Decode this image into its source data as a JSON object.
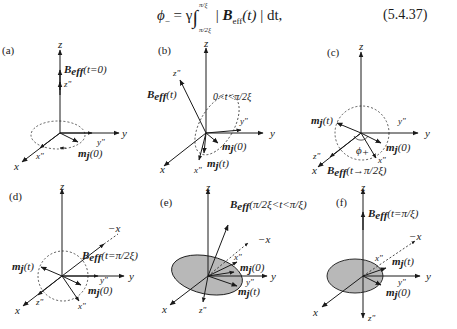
{
  "equation": {
    "lhs": "ϕ",
    "lhs_sub": "−",
    "equals": " = γ",
    "integral": "∫",
    "upper_limit": "π/ξ",
    "lower_limit": "π/2ξ",
    "integrand_bar_open": " | ",
    "integrand_B": "B",
    "integrand_sub": "eff",
    "integrand_arg": "(t)",
    "integrand_bar_close": " | dt,",
    "number": "(5.4.37)"
  },
  "panels": [
    {
      "id": "a",
      "label": "(a)",
      "axes": {
        "z": "z",
        "y": "y",
        "x": "x",
        "z2": "z\"",
        "y2": "y\"",
        "x2": "x\""
      },
      "field_label": {
        "B": "B",
        "sub": "eff",
        "arg": "(t=0)"
      },
      "m_labels": [
        "m_j(0)"
      ],
      "m0_label": {
        "m": "m",
        "sub": "j",
        "arg": "(0)"
      }
    },
    {
      "id": "b",
      "label": "(b)",
      "axes": {
        "z": "z",
        "y": "y",
        "x": "x",
        "z2": "z\"",
        "y2": "y\"",
        "x2": "x\""
      },
      "field_label": {
        "B": "B",
        "sub": "eff",
        "arg": "(t)"
      },
      "time_range": "0<t<π/2ξ",
      "m0_label": {
        "m": "m",
        "sub": "j",
        "arg": "(0)"
      },
      "mt_label": {
        "m": "m",
        "sub": "j",
        "arg": "(t)"
      }
    },
    {
      "id": "c",
      "label": "(c)",
      "axes": {
        "z": "z",
        "y": "y",
        "x": "x",
        "z2": "z\"",
        "y2": "y\"",
        "x2": "x\""
      },
      "field_label": {
        "B": "B",
        "sub": "eff",
        "arg": "(t→π/2ξ)"
      },
      "angle_label": "ϕ",
      "angle_sub": "+",
      "m0_label": {
        "m": "m",
        "sub": "j",
        "arg": "(0)"
      },
      "mt_label": {
        "m": "m",
        "sub": "j",
        "arg": "(t)"
      }
    },
    {
      "id": "d",
      "label": "(d)",
      "axes": {
        "z": "z",
        "y": "y",
        "x": "x",
        "negx": "−x",
        "z2": "z\"",
        "y2": "y\"",
        "x2": "x\""
      },
      "field_label": {
        "B": "B",
        "sub": "eff",
        "arg": "(t=π/2ξ)"
      },
      "m0_label": {
        "m": "m",
        "sub": "j",
        "arg": "(0)"
      },
      "mt_label": {
        "m": "m",
        "sub": "j",
        "arg": "(t)"
      }
    },
    {
      "id": "e",
      "label": "(e)",
      "axes": {
        "z": "z",
        "y": "y",
        "x": "x",
        "negx": "−x",
        "z2": "z\"",
        "y2": "y\"",
        "x2": "x\""
      },
      "field_label": {
        "B": "B",
        "sub": "eff",
        "arg": "(π/2ξ<t<π/ξ)"
      },
      "m0_label": {
        "m": "m",
        "sub": "j",
        "arg": "(0)"
      },
      "mt_label": {
        "m": "m",
        "sub": "j",
        "arg": "(t)"
      }
    },
    {
      "id": "f",
      "label": "(f)",
      "axes": {
        "z": "z",
        "y": "y",
        "x": "x",
        "negx": "−x",
        "z2": "z\"",
        "y2": "y\"",
        "x2": "x\""
      },
      "field_label": {
        "B": "B",
        "sub": "eff",
        "arg": "(t=π/ξ)"
      },
      "m0_label": {
        "m": "m",
        "sub": "j",
        "arg": "(0)"
      },
      "mt_label": {
        "m": "m",
        "sub": "j",
        "arg": "(t)"
      }
    }
  ],
  "colors": {
    "ink": "#1a1a1a",
    "cone_fill": "#b8b8b8",
    "background": "#ffffff"
  }
}
